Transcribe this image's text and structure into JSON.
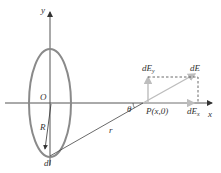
{
  "diagram": {
    "labels": {
      "y_axis": "y",
      "x_axis": "x",
      "origin": "O",
      "radius": "R",
      "element": "dl",
      "distance": "r",
      "angle": "θ",
      "point": "P(x,0)",
      "field": "dE",
      "field_y": "dE",
      "field_y_sub": "y",
      "field_x": "dE",
      "field_x_sub": "x"
    },
    "colors": {
      "ring": "#8a8a8a",
      "axis": "#555555",
      "vector": "#bdbdbd",
      "dashed": "#444444",
      "text": "#333333"
    }
  }
}
